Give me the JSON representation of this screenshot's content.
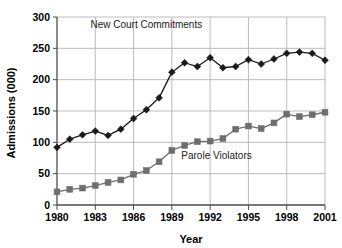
{
  "chart_data": {
    "type": "line",
    "title": "",
    "xlabel": "Year",
    "ylabel": "Admissions (000)",
    "xlim": [
      1980,
      2001
    ],
    "ylim": [
      0,
      300
    ],
    "ytick_step": 50,
    "xtick_step": 3,
    "grid": true,
    "legend_position": "inline-annotations",
    "x": [
      1980,
      1981,
      1982,
      1983,
      1984,
      1985,
      1986,
      1987,
      1988,
      1989,
      1990,
      1991,
      1992,
      1993,
      1994,
      1995,
      1996,
      1997,
      1998,
      1999,
      2000,
      2001
    ],
    "xticklabels": [
      "1980",
      "1983",
      "1986",
      "1989",
      "1992",
      "1995",
      "1998",
      "2001"
    ],
    "yticklabels": [
      "0",
      "50",
      "100",
      "150",
      "200",
      "250",
      "300"
    ],
    "series": [
      {
        "name": "New Court Commitments",
        "marker": "diamond",
        "color": "#1a1a1a",
        "label_x": 1987.0,
        "label_y": 283,
        "values": [
          92,
          105,
          112,
          118,
          111,
          121,
          138,
          152,
          171,
          212,
          227,
          221,
          235,
          219,
          221,
          232,
          225,
          233,
          242,
          244,
          242,
          231
        ]
      },
      {
        "name": "Parole Violators",
        "marker": "square",
        "color": "#6e6e6e",
        "label_x": 1992.5,
        "label_y": 73,
        "values": [
          21,
          25,
          27,
          31,
          36,
          40,
          49,
          55,
          69,
          87,
          95,
          101,
          102,
          106,
          121,
          126,
          122,
          131,
          145,
          141,
          144,
          148
        ]
      }
    ]
  },
  "axes": {
    "ylabel": "Admissions (000)",
    "xlabel": "Year",
    "yticks": [
      "300",
      "250",
      "200",
      "150",
      "100",
      "50",
      "0"
    ],
    "xticks": [
      "1980",
      "1983",
      "1986",
      "1989",
      "1992",
      "1995",
      "1998",
      "2001"
    ]
  },
  "annotations": {
    "series1_label": "New Court Commitments",
    "series2_label": "Parole Violators"
  },
  "colors": {
    "series1": "#1a1a1a",
    "series2": "#6e6e6e",
    "grid": "#b4b4b4",
    "axis": "#4d4d4d",
    "background": "#ffffff"
  }
}
